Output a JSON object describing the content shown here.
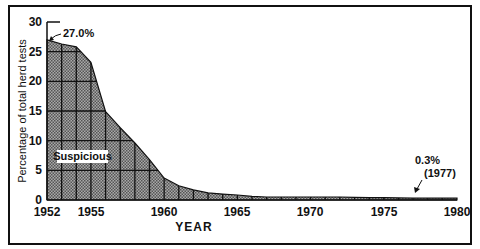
{
  "chart_data": {
    "type": "area",
    "title": "",
    "xlabel": "YEAR",
    "ylabel": "Percentage of total herd tests",
    "xlim": [
      1952,
      1980
    ],
    "ylim": [
      0,
      30
    ],
    "x_ticks": [
      "1952",
      "1955",
      "1960",
      "1965",
      "1970",
      "1975",
      "1980"
    ],
    "y_ticks": [
      "0",
      "5",
      "10",
      "15",
      "20",
      "25",
      "30"
    ],
    "grid": "yearly vertical lines and 5% horizontal lines inside filled area",
    "series": [
      {
        "name": "Suspicious",
        "x": [
          1952,
          1953,
          1954,
          1955,
          1956,
          1957,
          1958,
          1959,
          1960,
          1961,
          1962,
          1963,
          1964,
          1965,
          1966,
          1967,
          1968,
          1969,
          1970,
          1971,
          1972,
          1973,
          1974,
          1975,
          1976,
          1977,
          1978,
          1979,
          1980
        ],
        "values": [
          27.0,
          26.3,
          25.8,
          23.2,
          14.9,
          12.2,
          9.6,
          6.8,
          3.7,
          2.4,
          1.7,
          1.2,
          1.0,
          0.85,
          0.6,
          0.5,
          0.5,
          0.5,
          0.5,
          0.5,
          0.5,
          0.45,
          0.4,
          0.4,
          0.35,
          0.3,
          0.3,
          0.3,
          0.3
        ]
      }
    ],
    "annotations": [
      {
        "text": "27.0%",
        "x": 1952,
        "y": 27.0
      },
      {
        "text": "0.3%",
        "subtext": "(1977)",
        "x": 1977,
        "y": 0.3
      }
    ],
    "area_label": "Suspicious",
    "legend": "none"
  },
  "labels": {
    "ylabel": "Percentage of total herd tests",
    "xlabel": "YEAR",
    "area": "Suspicious",
    "ann_start": "27.0%",
    "ann_end_value": "0.3%",
    "ann_end_year": "(1977)",
    "y0": "0",
    "y5": "5",
    "y10": "10",
    "y15": "15",
    "y20": "20",
    "y25": "25",
    "y30": "30",
    "x1952": "1952",
    "x1955": "1955",
    "x1960": "1960",
    "x1965": "1965",
    "x1970": "1970",
    "x1975": "1975",
    "x1980": "1980"
  },
  "colors": {
    "ink": "#111111",
    "fill": "#8a8a8a",
    "background": "#ffffff"
  }
}
